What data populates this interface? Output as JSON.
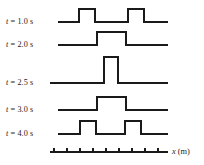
{
  "figure": {
    "type": "wave-pulse-superposition-diagram",
    "stroke_color": "#1a1a1a",
    "background_color": "#ffffff",
    "axis": {
      "label": "x (m)",
      "label_variable": "x",
      "label_unit": "(m)",
      "x_start": 50,
      "x_end": 168,
      "y": 152,
      "tick_count": 9,
      "tick_spacing": 13,
      "tick_height": 4
    },
    "rows": [
      {
        "label_variable": "t",
        "label_rest": " = 1.0 s",
        "label_full": "t = 1.0 s",
        "time_s": 1.0,
        "baseline_y": 22,
        "line_start_x": 58,
        "line_end_x": 168,
        "pulses": [
          {
            "left_x": 79,
            "right_x": 95,
            "amplitude": 13
          },
          {
            "left_x": 128,
            "right_x": 144,
            "amplitude": 13
          }
        ]
      },
      {
        "label_variable": "t",
        "label_rest": " = 2.0 s",
        "label_full": "t = 2.0 s",
        "time_s": 2.0,
        "baseline_y": 45,
        "line_start_x": 58,
        "line_end_x": 168,
        "pulses": [
          {
            "left_x": 97,
            "right_x": 126,
            "amplitude": 13
          }
        ]
      },
      {
        "label_variable": "t",
        "label_rest": " = 2.5 s",
        "label_full": "t = 2.5 s",
        "time_s": 2.5,
        "baseline_y": 83,
        "line_start_x": 50,
        "line_end_x": 168,
        "pulses": [
          {
            "left_x": 104,
            "right_x": 118,
            "amplitude": 26
          }
        ]
      },
      {
        "label_variable": "t",
        "label_rest": " = 3.0 s",
        "label_full": "t = 3.0 s",
        "time_s": 3.0,
        "baseline_y": 110,
        "line_start_x": 58,
        "line_end_x": 168,
        "pulses": [
          {
            "left_x": 97,
            "right_x": 126,
            "amplitude": 13
          }
        ]
      },
      {
        "label_variable": "t",
        "label_rest": " = 4.0 s",
        "label_full": "t = 4.0 s",
        "time_s": 4.0,
        "baseline_y": 134,
        "line_start_x": 58,
        "line_end_x": 168,
        "pulses": [
          {
            "left_x": 80,
            "right_x": 96,
            "amplitude": 13
          },
          {
            "left_x": 125,
            "right_x": 141,
            "amplitude": 13
          }
        ]
      }
    ],
    "label_positions": [
      {
        "x": 6,
        "y": 17
      },
      {
        "x": 6,
        "y": 40
      },
      {
        "x": 6,
        "y": 78
      },
      {
        "x": 6,
        "y": 105
      },
      {
        "x": 6,
        "y": 129
      }
    ],
    "axis_label_position": {
      "x": 172,
      "y": 147
    }
  }
}
